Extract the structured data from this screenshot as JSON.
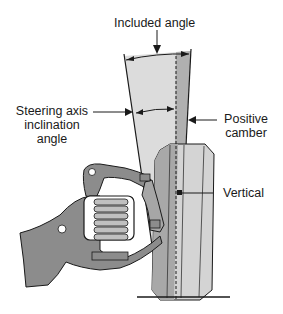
{
  "diagram": {
    "labels": {
      "included_angle": "Included angle",
      "steering_axis_line1": "Steering axis",
      "steering_axis_line2": "inclination",
      "steering_axis_line3": "angle",
      "positive_line1": "Positive",
      "positive_line2": "camber",
      "vertical": "Vertical"
    },
    "colors": {
      "light_gray": "#d9d9d9",
      "mid_gray": "#b3b3b3",
      "dark_gray": "#8c8c8c",
      "line": "#1a1a1a"
    }
  }
}
